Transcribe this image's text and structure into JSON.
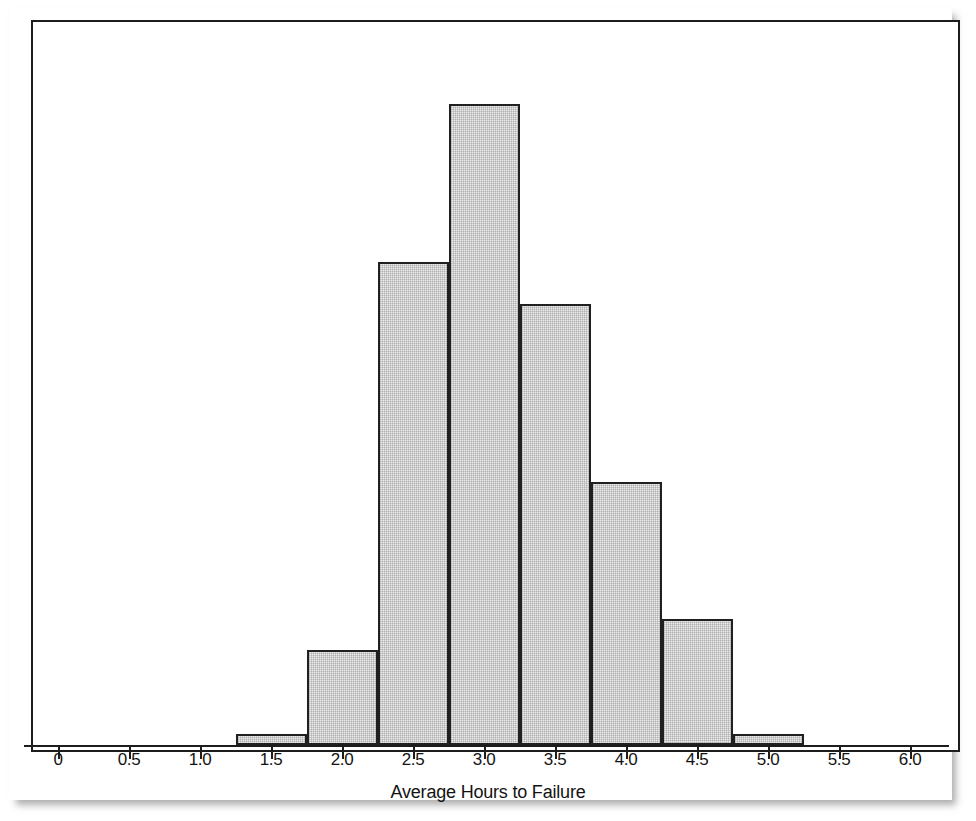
{
  "figure": {
    "kind": "histogram-figure",
    "background_color": "#ffffff",
    "frame_color": "#1d1d1d",
    "bar_fill_color": "#ececec",
    "bar_border_color": "#202020"
  },
  "axis": {
    "x_title": "Average Hours to Failure",
    "tick_labels": [
      "0",
      "0.5",
      "1.0",
      "1.5",
      "2.0",
      "2.5",
      "3.0",
      "3.5",
      "4.0",
      "4.5",
      "5.0",
      "5.5",
      "6.0"
    ],
    "tick_values": [
      0,
      0.5,
      1.0,
      1.5,
      2.0,
      2.5,
      3.0,
      3.5,
      4.0,
      4.5,
      5.0,
      5.5,
      6.0
    ]
  },
  "chart_data": {
    "type": "bar",
    "title": "",
    "subtitle": "",
    "xlabel": "Average Hours to Failure",
    "ylabel": "",
    "grid": false,
    "legend": null,
    "xlim": [
      -0.25,
      6.3
    ],
    "ylim": [
      0,
      61
    ],
    "bin_width": 0.5,
    "bin_edges": [
      1.25,
      1.75,
      2.25,
      2.75,
      3.25,
      3.75,
      4.25,
      4.75,
      5.25
    ],
    "bin_centers": [
      1.5,
      2.0,
      2.5,
      3.0,
      3.5,
      4.0,
      4.5,
      5.0
    ],
    "categories": [
      "1.25-1.75",
      "1.75-2.25",
      "2.25-2.75",
      "2.75-3.25",
      "3.25-3.75",
      "3.75-4.25",
      "4.25-4.75",
      "4.75-5.25"
    ],
    "values": [
      1,
      9,
      46,
      61,
      42,
      25,
      12,
      1
    ],
    "bars": [
      {
        "x0": 1.25,
        "x1": 1.75,
        "count": 1,
        "px_left": 236,
        "px_right": 307,
        "px_top": 733
      },
      {
        "x0": 1.75,
        "x1": 2.25,
        "count": 9,
        "px_left": 307,
        "px_right": 378,
        "px_top": 653
      },
      {
        "x0": 2.25,
        "x1": 2.75,
        "count": 46,
        "px_left": 378,
        "px_right": 449,
        "px_top": 261
      },
      {
        "x0": 2.75,
        "x1": 3.25,
        "count": 61,
        "px_left": 449,
        "px_right": 521,
        "px_top": 104
      },
      {
        "x0": 3.25,
        "x1": 3.75,
        "count": 42,
        "px_left": 521,
        "px_right": 592,
        "px_top": 302
      },
      {
        "x0": 3.75,
        "x1": 4.25,
        "count": 25,
        "px_left": 592,
        "px_right": 663,
        "px_top": 486
      },
      {
        "x0": 4.25,
        "x1": 4.75,
        "count": 12,
        "px_left": 663,
        "px_right": 734,
        "px_top": 619
      },
      {
        "x0": 4.75,
        "x1": 5.25,
        "count": 1,
        "px_left": 734,
        "px_right": 805,
        "px_top": 734
      }
    ]
  },
  "geometry": {
    "x_pixel_at_zero": 58,
    "pixels_per_unit": 142,
    "baseline_y": 745,
    "tick_length": 12,
    "tick_label_y": 750,
    "axis_title_y": 782,
    "axis_left": 24,
    "axis_right": 949
  }
}
